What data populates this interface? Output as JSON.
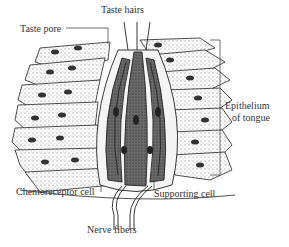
{
  "diagram": {
    "labels": {
      "taste_hairs": "Taste hairs",
      "taste_pore": "Taste pore",
      "epithelium_line1": "Epithelium",
      "epithelium_line2": "of tongue",
      "chemoreceptor_cell": "Chemoreceptor cell",
      "supporting_cell": "Supporting cell",
      "nerve_fibers": "Nerve fibers"
    },
    "colors": {
      "line": "#222222",
      "dark_cell": "#3a3a3a",
      "stipple": "#555555",
      "text": "#333333"
    }
  }
}
